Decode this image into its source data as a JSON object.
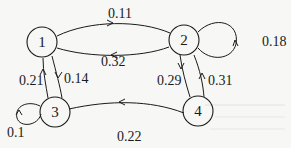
{
  "diagram": {
    "type": "markov-chain",
    "nodes": [
      {
        "id": "1",
        "label": "1"
      },
      {
        "id": "2",
        "label": "2"
      },
      {
        "id": "3",
        "label": "3"
      },
      {
        "id": "4",
        "label": "4"
      }
    ],
    "edges": [
      {
        "from": "1",
        "to": "2",
        "label": "0.11"
      },
      {
        "from": "2",
        "to": "1",
        "label": "0.32"
      },
      {
        "from": "2",
        "to": "2",
        "label": "0.18"
      },
      {
        "from": "1",
        "to": "3",
        "label": "0.14"
      },
      {
        "from": "3",
        "to": "1",
        "label": "0.21"
      },
      {
        "from": "2",
        "to": "4",
        "label": "0.29"
      },
      {
        "from": "4",
        "to": "2",
        "label": "0.31"
      },
      {
        "from": "4",
        "to": "3",
        "label": "0.22"
      },
      {
        "from": "3",
        "to": "3",
        "label": "0.1"
      }
    ]
  }
}
